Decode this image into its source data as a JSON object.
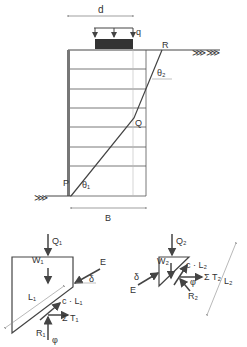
{
  "labels": {
    "d": "d",
    "q": "q",
    "R": "R",
    "theta2": "θ₂",
    "Q": "Q",
    "P": "P",
    "theta1": "θ₁",
    "B": "B",
    "Q1": "Q₁",
    "W1": "W₁",
    "E_left": "E",
    "delta_left": "δ",
    "L1": "L₁",
    "cL1": "c · L₁",
    "sumT1": "Σ T₁",
    "R1": "R₁",
    "phi_left": "φ",
    "Q2": "Q₂",
    "W2": "W₂",
    "cL2": "c · L₂",
    "sumT2": "Σ T₂",
    "delta_right": "δ",
    "E_right": "E",
    "phi_right": "φ",
    "R2": "R₂",
    "L2": "L₂"
  },
  "colors": {
    "line": "#444444",
    "load_block": "#333333",
    "thin": "#777777"
  }
}
